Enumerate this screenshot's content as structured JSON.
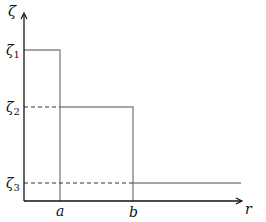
{
  "diagram": {
    "y_axis_label": "ζ",
    "x_axis_label": "r",
    "x_ticks": [
      {
        "id": "a",
        "label": "a"
      },
      {
        "id": "b",
        "label": "b"
      }
    ],
    "levels": [
      {
        "id": "zeta1",
        "symbol": "ζ",
        "subscript": "1"
      },
      {
        "id": "zeta2",
        "symbol": "ζ",
        "subscript": "2"
      },
      {
        "id": "zeta3",
        "symbol": "ζ",
        "subscript": "3"
      }
    ],
    "segments": [
      {
        "from": "0",
        "to": "a",
        "level": "zeta1"
      },
      {
        "from": "a",
        "to": "b",
        "level": "zeta2"
      },
      {
        "from": "b",
        "to": "∞",
        "level": "zeta3"
      }
    ],
    "colors": {
      "axis": "#111111",
      "step": "#888888",
      "dash": "#333333"
    }
  }
}
